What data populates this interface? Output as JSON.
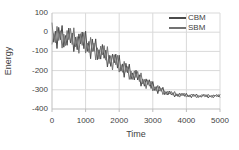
{
  "chart_data": {
    "type": "line",
    "title": "",
    "xlabel": "Time",
    "ylabel": "Energy",
    "xlim": [
      0,
      5000
    ],
    "ylim": [
      -400,
      100
    ],
    "grid": {
      "horizontal": true,
      "vertical": true
    },
    "legend_position": "top-right-inside",
    "colors": {
      "grid": "#d9d9d9",
      "axis": "#bfbfbf",
      "text": "#3f3f3f",
      "background": "#ffffff"
    },
    "xticks": [
      {
        "label": "0",
        "value": 0
      },
      {
        "label": "1000",
        "value": 1000
      },
      {
        "label": "2000",
        "value": 2000
      },
      {
        "label": "3000",
        "value": 3000
      },
      {
        "label": "4000",
        "value": 4000
      },
      {
        "label": "5000",
        "value": 5000
      }
    ],
    "yticks": [
      {
        "label": "100",
        "value": 100
      },
      {
        "label": "0",
        "value": 0
      },
      {
        "label": "-100",
        "value": -100
      },
      {
        "label": "-200",
        "value": -200
      },
      {
        "label": "-300",
        "value": -300
      },
      {
        "label": "-400",
        "value": -400
      }
    ],
    "x_start": 0,
    "x_step": 50,
    "series": [
      {
        "name": "CBM",
        "color": "#4a4a4a",
        "values": [
          50,
          -52,
          5,
          -85,
          25,
          -39,
          35,
          -78,
          -17,
          -68,
          22,
          -56,
          -4,
          -101,
          -26,
          -91,
          -9,
          -61,
          1,
          -86,
          5,
          -100,
          -48,
          -138,
          -36,
          -100,
          -35,
          -143,
          -91,
          -140,
          -64,
          -136,
          -94,
          -181,
          -120,
          -178,
          -114,
          -160,
          -114,
          -187,
          -120,
          -203,
          -165,
          -235,
          -162,
          -211,
          -166,
          -246,
          -212,
          -249,
          -198,
          -249,
          -222,
          -281,
          -243,
          -281,
          -243,
          -273,
          -248,
          -293,
          -257,
          -303,
          -283,
          -320,
          -283,
          -308,
          -287,
          -325,
          -310,
          -327,
          -307,
          -326,
          -315,
          -337,
          -321,
          -335,
          -318,
          -329,
          -318,
          -334,
          -319,
          -336,
          -327,
          -341,
          -323,
          -334,
          -322,
          -340,
          -330,
          -338,
          -324,
          -336,
          -327,
          -342,
          -330,
          -339,
          -327,
          -334,
          -325,
          -337,
          -324
        ]
      },
      {
        "name": "SBM",
        "color": "#737373",
        "values": [
          -64,
          -7,
          -55,
          30,
          -43,
          8,
          -83,
          -10,
          -70,
          9,
          -39,
          20,
          -64,
          23,
          -76,
          -23,
          -110,
          -8,
          -69,
          -1,
          -109,
          -56,
          -106,
          -27,
          -101,
          -56,
          -145,
          -81,
          -140,
          -72,
          -118,
          -70,
          -146,
          -75,
          -163,
          -122,
          -197,
          -117,
          -170,
          -121,
          -208,
          -169,
          -209,
          -152,
          -209,
          -179,
          -246,
          -202,
          -246,
          -201,
          -236,
          -204,
          -257,
          -212,
          -270,
          -246,
          -294,
          -248,
          -281,
          -255,
          -306,
          -285,
          -307,
          -277,
          -307,
          -292,
          -325,
          -305,
          -325,
          -307,
          -322,
          -309,
          -328,
          -309,
          -331,
          -321,
          -338,
          -319,
          -331,
          -319,
          -338,
          -329,
          -337,
          -322,
          -334,
          -326,
          -341,
          -329,
          -338,
          -326,
          -333,
          -324,
          -336,
          -323,
          -337,
          -329,
          -342,
          -327,
          -335,
          -325,
          -340
        ]
      }
    ]
  }
}
